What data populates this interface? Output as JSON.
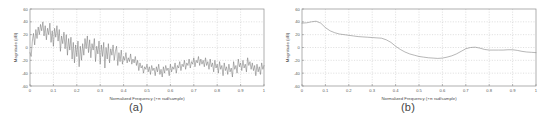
{
  "figure": {
    "panels": [
      {
        "caption": "(a)",
        "name": "panel-a"
      },
      {
        "caption": "(b)",
        "name": "panel-b"
      }
    ]
  },
  "chart_data": [
    {
      "type": "line",
      "title": "",
      "subtitle": "",
      "caption": "(a)",
      "xlabel": "Normalized Frequency  (×π rad/sample)",
      "ylabel": "Magnitude (dB)",
      "xlim": [
        0,
        1
      ],
      "ylim": [
        -60,
        60
      ],
      "xticks": [
        0,
        0.1,
        0.2,
        0.3,
        0.4,
        0.5,
        0.6,
        0.7,
        0.8,
        0.9,
        1
      ],
      "xticklabels": [
        "0",
        "0.1",
        "0.2",
        "0.3",
        "0.4",
        "0.5",
        "0.6",
        "0.7",
        "0.8",
        "0.9",
        "1"
      ],
      "yticks": [
        -60,
        -40,
        -20,
        0,
        20,
        40,
        60
      ],
      "yticklabels": [
        "-60",
        "-40",
        "-20",
        "0",
        "20",
        "40",
        "60"
      ],
      "grid": true,
      "legend": false,
      "series": [
        {
          "name": "raw periodogram",
          "color": "#6f6f6f",
          "x": [
            0.0,
            0.005,
            0.01,
            0.015,
            0.02,
            0.025,
            0.03,
            0.035,
            0.04,
            0.045,
            0.05,
            0.055,
            0.06,
            0.065,
            0.07,
            0.075,
            0.08,
            0.085,
            0.09,
            0.095,
            0.1,
            0.105,
            0.11,
            0.115,
            0.12,
            0.125,
            0.13,
            0.135,
            0.14,
            0.145,
            0.15,
            0.155,
            0.16,
            0.165,
            0.17,
            0.175,
            0.18,
            0.185,
            0.19,
            0.195,
            0.2,
            0.205,
            0.21,
            0.215,
            0.22,
            0.225,
            0.23,
            0.235,
            0.24,
            0.245,
            0.25,
            0.255,
            0.26,
            0.265,
            0.27,
            0.275,
            0.28,
            0.285,
            0.29,
            0.295,
            0.3,
            0.305,
            0.31,
            0.315,
            0.32,
            0.325,
            0.33,
            0.335,
            0.34,
            0.345,
            0.35,
            0.355,
            0.36,
            0.365,
            0.37,
            0.375,
            0.38,
            0.385,
            0.39,
            0.395,
            0.4,
            0.405,
            0.41,
            0.415,
            0.42,
            0.425,
            0.43,
            0.435,
            0.44,
            0.445,
            0.45,
            0.455,
            0.46,
            0.465,
            0.47,
            0.475,
            0.48,
            0.485,
            0.49,
            0.495,
            0.5,
            0.505,
            0.51,
            0.515,
            0.52,
            0.525,
            0.53,
            0.535,
            0.54,
            0.545,
            0.55,
            0.555,
            0.56,
            0.565,
            0.57,
            0.575,
            0.58,
            0.585,
            0.59,
            0.595,
            0.6,
            0.605,
            0.61,
            0.615,
            0.62,
            0.625,
            0.63,
            0.635,
            0.64,
            0.645,
            0.65,
            0.655,
            0.66,
            0.665,
            0.67,
            0.675,
            0.68,
            0.685,
            0.69,
            0.695,
            0.7,
            0.705,
            0.71,
            0.715,
            0.72,
            0.725,
            0.73,
            0.735,
            0.74,
            0.745,
            0.75,
            0.755,
            0.76,
            0.765,
            0.77,
            0.775,
            0.78,
            0.785,
            0.79,
            0.795,
            0.8,
            0.805,
            0.81,
            0.815,
            0.82,
            0.825,
            0.83,
            0.835,
            0.84,
            0.845,
            0.85,
            0.855,
            0.86,
            0.865,
            0.87,
            0.875,
            0.88,
            0.885,
            0.89,
            0.895,
            0.9,
            0.905,
            0.91,
            0.915,
            0.92,
            0.925,
            0.93,
            0.935,
            0.94,
            0.945,
            0.95,
            0.955,
            0.96,
            0.965,
            0.97,
            0.975,
            0.98,
            0.985,
            0.99,
            0.995,
            1.0
          ],
          "y": [
            -8,
            -14,
            10,
            22,
            4,
            28,
            14,
            32,
            20,
            36,
            26,
            40,
            18,
            34,
            12,
            30,
            20,
            38,
            8,
            26,
            2,
            30,
            16,
            34,
            10,
            28,
            -6,
            18,
            6,
            24,
            -2,
            20,
            -12,
            14,
            -4,
            16,
            -18,
            8,
            -24,
            4,
            -14,
            10,
            -30,
            2,
            -20,
            6,
            -12,
            14,
            -2,
            18,
            -8,
            12,
            -16,
            6,
            -4,
            14,
            -22,
            2,
            -10,
            10,
            -26,
            4,
            -14,
            8,
            -32,
            0,
            -18,
            6,
            -24,
            -2,
            -12,
            4,
            -20,
            -6,
            2,
            -28,
            -8,
            -22,
            -4,
            -26,
            -14,
            -20,
            -8,
            -24,
            -16,
            -22,
            -10,
            -26,
            -18,
            -24,
            -14,
            -28,
            -20,
            -36,
            -24,
            -32,
            -28,
            -40,
            -30,
            -34,
            -26,
            -38,
            -30,
            -42,
            -28,
            -36,
            -32,
            -44,
            -30,
            -38,
            -26,
            -42,
            -34,
            -46,
            -30,
            -40,
            -28,
            -36,
            -32,
            -44,
            -26,
            -38,
            -30,
            -34,
            -24,
            -40,
            -28,
            -32,
            -22,
            -36,
            -26,
            -30,
            -20,
            -34,
            -24,
            -28,
            -18,
            -32,
            -22,
            -26,
            -16,
            -30,
            -20,
            -24,
            -14,
            -28,
            -18,
            -26,
            -20,
            -30,
            -16,
            -28,
            -22,
            -34,
            -18,
            -30,
            -24,
            -38,
            -20,
            -32,
            -26,
            -40,
            -22,
            -34,
            -28,
            -44,
            -24,
            -36,
            -30,
            -42,
            -26,
            -38,
            -32,
            -46,
            -22,
            -34,
            -28,
            -40,
            -18,
            -30,
            -24,
            -36,
            -20,
            -32,
            -26,
            -38,
            -16,
            -28,
            -22,
            -34,
            -24,
            -36,
            -28,
            -44,
            -26,
            -38,
            -30,
            -42,
            -24,
            -34,
            -28,
            -40,
            -22,
            -30,
            -26,
            -34,
            -20,
            -28,
            -18
          ]
        }
      ]
    },
    {
      "type": "line",
      "title": "",
      "subtitle": "",
      "caption": "(b)",
      "xlabel": "Normalized Frequency  (×π rad/sample)",
      "ylabel": "Magnitude (dB)",
      "xlim": [
        0,
        1
      ],
      "ylim": [
        -60,
        60
      ],
      "xticks": [
        0,
        0.1,
        0.2,
        0.3,
        0.4,
        0.5,
        0.6,
        0.7,
        0.8,
        0.9,
        1
      ],
      "xticklabels": [
        "0",
        "0.1",
        "0.2",
        "0.3",
        "0.4",
        "0.5",
        "0.6",
        "0.7",
        "0.8",
        "0.9",
        "1"
      ],
      "yticks": [
        -60,
        -40,
        -20,
        0,
        20,
        40,
        60
      ],
      "yticklabels": [
        "-60",
        "-40",
        "-20",
        "0",
        "20",
        "40",
        "60"
      ],
      "grid": true,
      "legend": false,
      "series": [
        {
          "name": "smoothed spectral estimate",
          "color": "#7a7a7a",
          "x": [
            0.0,
            0.02,
            0.04,
            0.06,
            0.08,
            0.1,
            0.12,
            0.14,
            0.16,
            0.18,
            0.2,
            0.22,
            0.24,
            0.26,
            0.28,
            0.3,
            0.32,
            0.34,
            0.36,
            0.38,
            0.4,
            0.42,
            0.44,
            0.46,
            0.48,
            0.5,
            0.52,
            0.54,
            0.56,
            0.58,
            0.6,
            0.62,
            0.64,
            0.66,
            0.68,
            0.7,
            0.72,
            0.74,
            0.76,
            0.78,
            0.8,
            0.82,
            0.84,
            0.86,
            0.88,
            0.9,
            0.92,
            0.94,
            0.96,
            0.98,
            1.0
          ],
          "y": [
            38,
            38.5,
            40,
            41,
            38,
            31,
            26,
            23,
            21,
            20,
            19,
            18,
            17,
            16.5,
            16,
            15.5,
            15,
            14.5,
            12,
            8,
            2,
            -3,
            -7,
            -10,
            -12,
            -14,
            -15,
            -16,
            -16.5,
            -17,
            -16.5,
            -15,
            -13,
            -10,
            -6,
            -2,
            0,
            0.5,
            -1,
            -3,
            -4,
            -4,
            -4,
            -4,
            -3.5,
            -3.5,
            -4.5,
            -6,
            -7,
            -7.5,
            -8
          ]
        }
      ]
    }
  ]
}
